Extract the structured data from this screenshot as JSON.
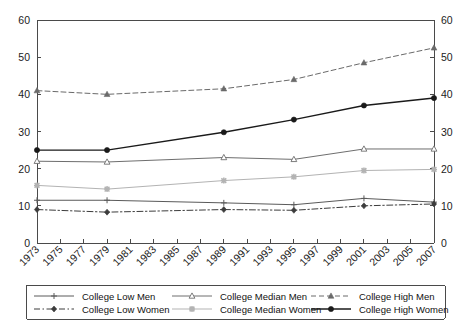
{
  "chart_data": {
    "type": "line",
    "title": "",
    "subtitle": "",
    "xlabel": "",
    "ylabel": "",
    "xlim": [
      1973,
      2007
    ],
    "ylim": [
      0,
      60
    ],
    "yticks": [
      0,
      10,
      20,
      30,
      40,
      50,
      60
    ],
    "ytick_labels": [
      "0",
      "10",
      "20",
      "30",
      "40",
      "50",
      "60"
    ],
    "right_axis": true,
    "right_ytick_labels": [
      "0",
      "10",
      "20",
      "30",
      "40",
      "50",
      "60"
    ],
    "grid": false,
    "legend_position": "bottom",
    "xticks": [
      1973,
      1975,
      1977,
      1979,
      1981,
      1983,
      1985,
      1987,
      1989,
      1991,
      1993,
      1995,
      1997,
      1999,
      2001,
      2003,
      2005,
      2007
    ],
    "xtick_labels": [
      "1973",
      "1975",
      "1977",
      "1979",
      "1981",
      "1983",
      "1985",
      "1987",
      "1989",
      "1991",
      "1993",
      "1995",
      "1997",
      "1999",
      "2001",
      "2003",
      "2005",
      "2007"
    ],
    "marker_years": [
      1973,
      1979,
      1989,
      1995,
      2001,
      2007
    ],
    "series": [
      {
        "name": "College Low Men",
        "marker": "plus",
        "line_style": "solid",
        "color": "#5a5a5a",
        "width": 1,
        "x": [
          1973,
          1979,
          1989,
          1995,
          2001,
          2007
        ],
        "values": [
          11.5,
          11.5,
          10.8,
          10.3,
          12.0,
          11.0
        ]
      },
      {
        "name": "College Median Men",
        "marker": "triangle-open",
        "line_style": "solid",
        "color": "#6e6e6e",
        "width": 1,
        "x": [
          1973,
          1979,
          1989,
          1995,
          2001,
          2007
        ],
        "values": [
          22.0,
          21.8,
          23.0,
          22.5,
          25.3,
          25.3
        ]
      },
      {
        "name": "College High Men",
        "marker": "triangle-filled",
        "line_style": "dashed",
        "color": "#6a6a6a",
        "width": 1,
        "x": [
          1973,
          1979,
          1989,
          1995,
          2001,
          2007
        ],
        "values": [
          41.0,
          40.0,
          41.5,
          44.0,
          48.5,
          52.5
        ]
      },
      {
        "name": "College Low Women",
        "marker": "diamond",
        "line_style": "dashdot",
        "color": "#3c3c3c",
        "width": 1,
        "x": [
          1973,
          1979,
          1989,
          1995,
          2001,
          2007
        ],
        "values": [
          9.0,
          8.3,
          9.0,
          8.8,
          10.0,
          10.5
        ]
      },
      {
        "name": "College Median Women",
        "marker": "x-light",
        "line_style": "solid",
        "color": "#b3b3b3",
        "width": 1,
        "x": [
          1973,
          1979,
          1989,
          1995,
          2001,
          2007
        ],
        "values": [
          15.5,
          14.5,
          16.8,
          17.8,
          19.5,
          19.8
        ]
      },
      {
        "name": "College High Women",
        "marker": "circle",
        "line_style": "solid",
        "color": "#1a1a1a",
        "width": 1.4,
        "x": [
          1973,
          1979,
          1989,
          1995,
          2001,
          2007
        ],
        "values": [
          25.0,
          25.0,
          29.8,
          33.2,
          37.0,
          39.0
        ]
      }
    ]
  },
  "legend": {
    "entries": [
      {
        "label": "College Low Men"
      },
      {
        "label": "College Median Men"
      },
      {
        "label": "College High Men"
      },
      {
        "label": "College Low Women"
      },
      {
        "label": "College Median Women"
      },
      {
        "label": "College High Women"
      }
    ]
  }
}
